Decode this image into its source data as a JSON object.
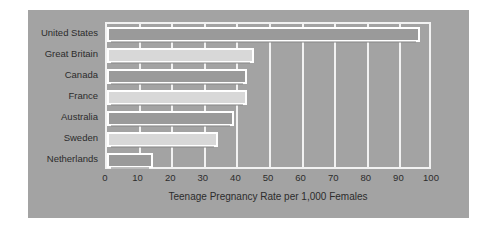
{
  "chart_data": {
    "type": "bar",
    "orientation": "horizontal",
    "title": "",
    "xlabel": "Teenage Pregnancy Rate per 1,000 Females",
    "ylabel": "",
    "categories": [
      "United States",
      "Great Britain",
      "Canada",
      "France",
      "Australia",
      "Sweden",
      "Netherlands"
    ],
    "values": [
      96,
      45,
      43,
      43,
      39,
      34,
      14
    ],
    "xlim": [
      0,
      100
    ],
    "xticks": [
      0,
      10,
      20,
      30,
      40,
      50,
      60,
      70,
      80,
      90,
      100
    ],
    "xtick_labels": [
      "0",
      "10",
      "20",
      "30",
      "40",
      "50",
      "60",
      "70",
      "80",
      "90",
      "100"
    ],
    "grid": true,
    "legend": null,
    "series": [
      {
        "name": "Teenage Pregnancy Rate per 1,000 Females",
        "values": [
          96,
          45,
          43,
          43,
          39,
          34,
          14
        ]
      }
    ],
    "bar_styles": [
      "dark",
      "light",
      "dark",
      "light",
      "dark",
      "light",
      "dark"
    ],
    "colors": {
      "panel_background": "#a3a3a3",
      "page_background": "#ffffff",
      "grid": "#f2f2f2",
      "axis_frame": "#f2f2f2",
      "bar_dark": "#9a9a9a",
      "bar_light": "#d8d8d8",
      "bar_border": "#ffffff",
      "text": "#2c2c2c"
    }
  }
}
